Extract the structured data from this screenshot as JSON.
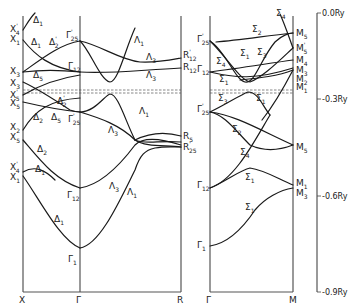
{
  "panels": [
    {
      "id": "left",
      "k_points": [
        "X",
        "Γ",
        "R"
      ],
      "x_labels": [
        {
          "sym": "X",
          "sub": "4",
          "sup": "'"
        },
        {
          "sym": "X",
          "sub": "1"
        },
        {
          "sym": "X",
          "sub": "3"
        },
        {
          "sym": "X",
          "sub": "3"
        },
        {
          "sym": "X",
          "sub": "5",
          "sup": "'"
        },
        {
          "sym": "X",
          "sub": "5"
        },
        {
          "sym": "X",
          "sub": "2"
        },
        {
          "sym": "X",
          "sub": "5"
        },
        {
          "sym": "X",
          "sub": "4",
          "sup": "'"
        },
        {
          "sym": "X",
          "sub": "1"
        }
      ],
      "gamma_labels": [
        {
          "sym": "Γ",
          "sub": "25",
          "sup": "'"
        },
        {
          "sym": "Γ",
          "sub": "12"
        },
        {
          "sym": "Γ",
          "sub": "25",
          "sup": "'"
        },
        {
          "sym": "Γ",
          "sub": "12"
        },
        {
          "sym": "Γ",
          "sub": "1"
        }
      ],
      "r_labels": [
        {
          "sym": "R",
          "sub": "12",
          "sup": "'"
        },
        {
          "sym": "R",
          "sub": "12"
        },
        {
          "sym": "R",
          "sub": "5"
        },
        {
          "sym": "R",
          "sub": "25",
          "sup": "'"
        }
      ],
      "branch_labels": [
        {
          "sym": "Δ",
          "sub": "1"
        },
        {
          "sym": "Δ",
          "sub": "1"
        },
        {
          "sym": "Δ",
          "sub": "2",
          "sup": "'"
        },
        {
          "sym": "Δ",
          "sub": "5"
        },
        {
          "sym": "Δ",
          "sub": "2",
          "sup": "'"
        },
        {
          "sym": "Δ",
          "sub": "2"
        },
        {
          "sym": "Δ",
          "sub": "5"
        },
        {
          "sym": "Δ",
          "sub": "2"
        },
        {
          "sym": "Δ",
          "sub": "1"
        },
        {
          "sym": "Δ",
          "sub": "1"
        },
        {
          "sym": "Λ",
          "sub": "1"
        },
        {
          "sym": "Λ",
          "sub": "3"
        },
        {
          "sym": "Λ",
          "sub": "3"
        },
        {
          "sym": "Λ",
          "sub": "1"
        },
        {
          "sym": "Λ",
          "sub": "3"
        },
        {
          "sym": "Λ",
          "sub": "3"
        },
        {
          "sym": "Λ",
          "sub": "1"
        }
      ]
    },
    {
      "id": "right",
      "k_points": [
        "Γ",
        "M"
      ],
      "gamma_labels": [
        {
          "sym": "Γ",
          "sub": "25",
          "sup": "'"
        },
        {
          "sym": "Γ",
          "sub": "12"
        },
        {
          "sym": "Γ",
          "sub": "25",
          "sup": "'"
        },
        {
          "sym": "Γ",
          "sub": "12"
        },
        {
          "sym": "Γ",
          "sub": "1"
        }
      ],
      "m_labels": [
        {
          "sym": "M",
          "sub": "5"
        },
        {
          "sym": "M",
          "sub": "5",
          "sup": "'"
        },
        {
          "sym": "M",
          "sub": "4"
        },
        {
          "sym": "M",
          "sub": "3"
        },
        {
          "sym": "M",
          "sub": "2"
        },
        {
          "sym": "M",
          "sub": "1"
        },
        {
          "sym": "M",
          "sub": "5"
        },
        {
          "sym": "M",
          "sub": "1"
        },
        {
          "sym": "M",
          "sub": "3"
        }
      ],
      "branch_labels": [
        {
          "sym": "Σ",
          "sub": "4"
        },
        {
          "sym": "Σ",
          "sub": "2"
        },
        {
          "sym": "Σ",
          "sub": "3"
        },
        {
          "sym": "Σ",
          "sub": "1"
        },
        {
          "sym": "Σ",
          "sub": "4"
        },
        {
          "sym": "Σ",
          "sub": "1"
        },
        {
          "sym": "Σ",
          "sub": "3"
        },
        {
          "sym": "Σ",
          "sub": "1"
        },
        {
          "sym": "Σ",
          "sub": "2"
        },
        {
          "sym": "Σ",
          "sub": "4"
        },
        {
          "sym": "Σ",
          "sub": "1"
        },
        {
          "sym": "Σ",
          "sub": "1"
        }
      ]
    }
  ],
  "energy_axis": {
    "unit": "Ry",
    "ticks": [
      "0.0Ry",
      "-0.3Ry",
      "-0.6Ry",
      "-0.9Ry"
    ]
  },
  "fermi_level": "dashed double line"
}
